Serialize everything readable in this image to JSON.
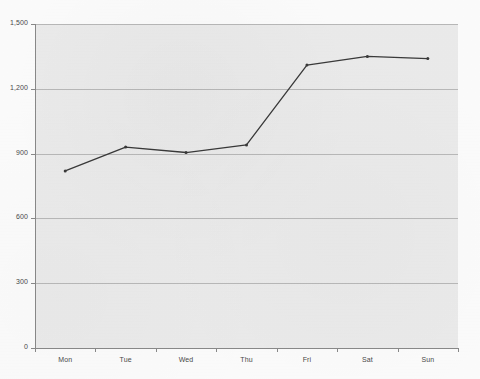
{
  "chart_data": {
    "type": "line",
    "title": "",
    "subtitle": "",
    "xlabel": "",
    "ylabel": "",
    "categories": [
      "Mon",
      "Tue",
      "Wed",
      "Thu",
      "Fri",
      "Sat",
      "Sun"
    ],
    "values": [
      820,
      930,
      905,
      940,
      1310,
      1350,
      1340
    ],
    "series": [
      {
        "name": "",
        "values": [
          820,
          930,
          905,
          940,
          1310,
          1350,
          1340
        ]
      }
    ],
    "ylim": [
      0,
      1500
    ],
    "y_ticks": [
      0,
      300,
      600,
      900,
      1200,
      1500
    ],
    "y_tick_labels": [
      "0",
      "300",
      "600",
      "900",
      "1,200",
      "1,500"
    ],
    "x_tick_labels": [
      "Mon",
      "Tue",
      "Wed",
      "Thu",
      "Fri",
      "Sat",
      "Sun"
    ],
    "grid": true,
    "grid_axis": "y",
    "legend": false,
    "legend_position": "none",
    "marker": "point",
    "line_color": "#3a3a3a",
    "grid_color": "#b9b9b9",
    "axis_color": "#8a8a8a",
    "plot_background": "#ececec",
    "figure_background": "#fdfdfd",
    "tick_label_color": "#4a4a4a"
  },
  "axes": {
    "y_axis_name": "y-axis",
    "x_axis_name": "x-axis"
  }
}
